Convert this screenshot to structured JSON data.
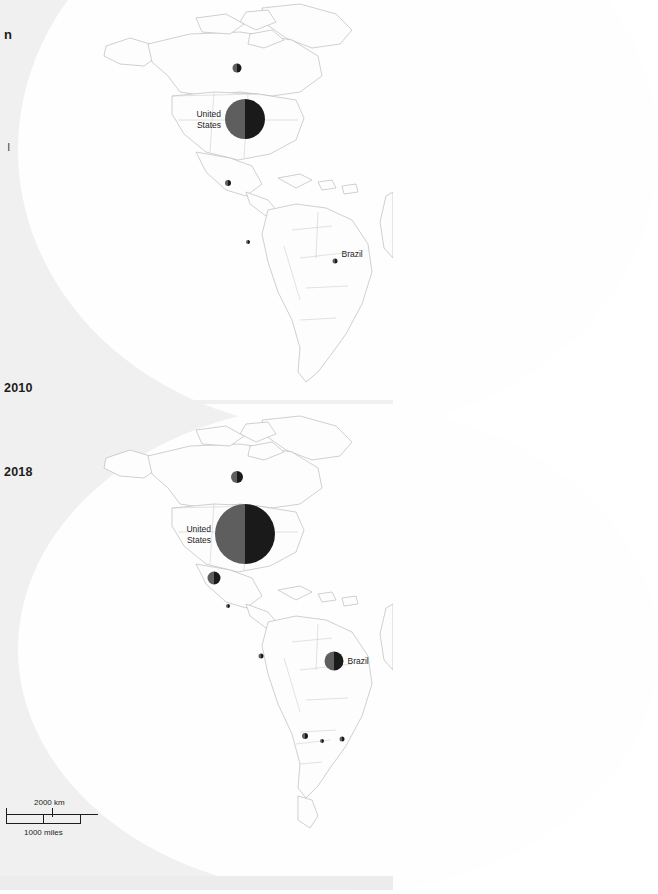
{
  "figure": {
    "title_fragment": "n",
    "subtitle_fragment": "8",
    "note_fragment": "l",
    "background_color": "#f0f0f0",
    "land_fill": "#fdfdfd",
    "border_color": "#b8b8b8",
    "marker_dark": "#1a1a1a",
    "marker_light": "#5e5e5e"
  },
  "panels": [
    {
      "id": "panel-2010",
      "year_label": "2010",
      "markers": [
        {
          "name": "canada",
          "label": "",
          "radius": 4.5,
          "x": 237,
          "y": 65
        },
        {
          "name": "united-states",
          "label": "United\nStates",
          "radius": 20,
          "x": 245,
          "y": 119,
          "label_side": "left"
        },
        {
          "name": "mexico",
          "label": "",
          "radius": 3,
          "x": 228,
          "y": 177
        },
        {
          "name": "colombia",
          "label": "",
          "radius": 2,
          "x": 248,
          "y": 234
        },
        {
          "name": "brazil",
          "label": "Brazil",
          "radius": 2.5,
          "x": 335,
          "y": 254,
          "label_side": "right"
        }
      ]
    },
    {
      "id": "panel-2018",
      "year_label": "2018",
      "markers": [
        {
          "name": "canada",
          "label": "",
          "radius": 6,
          "x": 237,
          "y": 477
        },
        {
          "name": "united-states",
          "label": "United\nStates",
          "radius": 30,
          "x": 245,
          "y": 534,
          "label_side": "left"
        },
        {
          "name": "mexico",
          "label": "",
          "radius": 6.5,
          "x": 214,
          "y": 578
        },
        {
          "name": "guatemala",
          "label": "",
          "radius": 2,
          "x": 228,
          "y": 598
        },
        {
          "name": "colombia",
          "label": "",
          "radius": 2.5,
          "x": 261,
          "y": 649
        },
        {
          "name": "brazil",
          "label": "Brazil",
          "radius": 9.5,
          "x": 334,
          "y": 661,
          "label_side": "right"
        },
        {
          "name": "chile",
          "label": "",
          "radius": 3,
          "x": 305,
          "y": 730
        },
        {
          "name": "argentina",
          "label": "",
          "radius": 2,
          "x": 322,
          "y": 733
        },
        {
          "name": "uruguay",
          "label": "",
          "radius": 2.5,
          "x": 342,
          "y": 732
        }
      ]
    }
  ],
  "scale_bar": {
    "km_label": "2000 km",
    "miles_label": "1000 miles"
  }
}
